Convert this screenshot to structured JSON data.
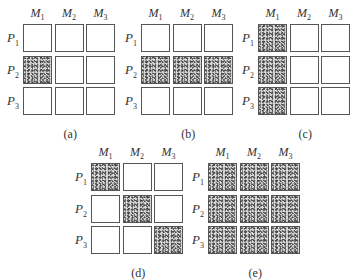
{
  "column_labels": [
    {
      "base": "M",
      "sub": "1"
    },
    {
      "base": "M",
      "sub": "2"
    },
    {
      "base": "M",
      "sub": "3"
    }
  ],
  "row_labels": [
    {
      "base": "P",
      "sub": "1"
    },
    {
      "base": "P",
      "sub": "2"
    },
    {
      "base": "P",
      "sub": "3"
    }
  ],
  "colors": {
    "border": "#555555",
    "fill_stipple": "#d8d8d8",
    "background": "#ffffff"
  },
  "panels": [
    {
      "caption": "(a)",
      "origin": [
        23,
        24
      ],
      "show_row_labels": true,
      "filled": [
        [
          0,
          0,
          0
        ],
        [
          1,
          0,
          0
        ],
        [
          0,
          0,
          0
        ]
      ]
    },
    {
      "caption": "(b)",
      "origin": [
        141,
        24
      ],
      "show_row_labels": true,
      "filled": [
        [
          0,
          0,
          0
        ],
        [
          1,
          1,
          1
        ],
        [
          0,
          0,
          0
        ]
      ]
    },
    {
      "caption": "(c)",
      "origin": [
        258,
        24
      ],
      "show_row_labels": true,
      "filled": [
        [
          1,
          0,
          0
        ],
        [
          1,
          0,
          0
        ],
        [
          1,
          0,
          0
        ]
      ]
    },
    {
      "caption": "(d)",
      "origin": [
        91,
        163
      ],
      "show_row_labels": true,
      "filled": [
        [
          1,
          0,
          0
        ],
        [
          0,
          1,
          0
        ],
        [
          0,
          0,
          1
        ]
      ]
    },
    {
      "caption": "(e)",
      "origin": [
        208,
        163
      ],
      "show_row_labels": true,
      "filled": [
        [
          1,
          1,
          1
        ],
        [
          1,
          1,
          1
        ],
        [
          1,
          1,
          1
        ]
      ]
    }
  ]
}
